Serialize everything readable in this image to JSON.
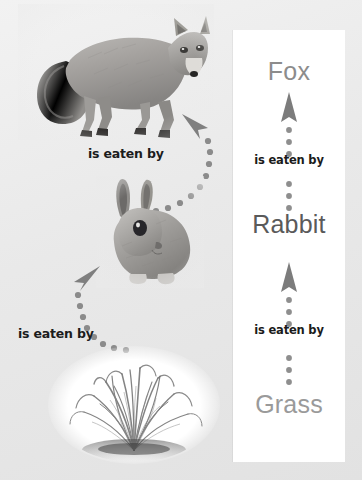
{
  "diagram": {
    "background_color": "#ebebeb",
    "panel_color": "#ffffff"
  },
  "pictorial": {
    "images": [
      {
        "name": "fox-photo",
        "alt": "Photograph of a fox standing, in grayscale"
      },
      {
        "name": "rabbit-photo",
        "alt": "Photograph of a rabbit sitting, in grayscale"
      },
      {
        "name": "grass-photo",
        "alt": "Photograph of a tuft of grass in a white oval vignette"
      }
    ],
    "captions": [
      {
        "name": "caption-fox",
        "text": "is eaten by"
      },
      {
        "name": "caption-rabbit",
        "text": "is eaten by"
      }
    ],
    "arrows": [
      {
        "name": "curve-arrow-rabbit-to-fox",
        "style": "dotted-curve",
        "points_to": "fox"
      },
      {
        "name": "curve-arrow-grass-to-rabbit",
        "style": "dotted-curve",
        "points_to": "rabbit"
      }
    ]
  },
  "chain": {
    "nodes": [
      {
        "label": "Fox",
        "color": "#8c8c8c"
      },
      {
        "label": "Rabbit",
        "color": "#5a5a5a"
      },
      {
        "label": "Grass",
        "color": "#9a9a9a"
      }
    ],
    "links": [
      {
        "label": "is eaten by",
        "direction": "up",
        "from": "Rabbit",
        "to": "Fox"
      },
      {
        "label": "is eaten by",
        "direction": "up",
        "from": "Grass",
        "to": "Rabbit"
      }
    ]
  },
  "artifact": {
    "bottom_text": ""
  }
}
